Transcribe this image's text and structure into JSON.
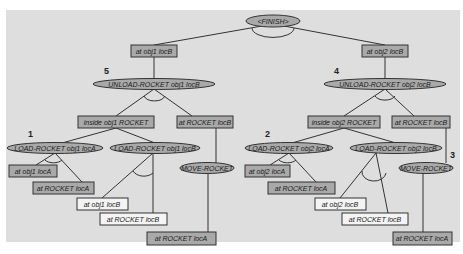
{
  "diagram": {
    "type": "planning-goal-tree",
    "colors": {
      "background": "#dedede",
      "page": "#ffffff",
      "node_fill_gray": "#a9a9a9",
      "node_fill_white": "#f4f4f4",
      "stroke": "#333333"
    },
    "root": {
      "label": "<FINISH>"
    },
    "goals": [
      {
        "id": "g1",
        "label": "at obj1 locB"
      },
      {
        "id": "g2",
        "label": "at obj2 locB"
      }
    ],
    "step_numbers": {
      "s5": "5",
      "s4": "4",
      "s1": "1",
      "s2": "2",
      "s3": "3"
    },
    "actions": {
      "unload1": "UNLOAD-ROCKET obj1 locB",
      "unload2": "UNLOAD-ROCKET obj2 locB",
      "load1a": "LOAD-ROCKET obj1 locA",
      "load1b": "LOAD-ROCKET obj1 locB",
      "move1": "MOVE-ROCKET",
      "load2a": "LOAD-ROCKET obj2 locA",
      "load2b": "LOAD-ROCKET obj2 locB",
      "move2": "MOVE-ROCKET"
    },
    "conditions": {
      "inside1": "inside obj1 ROCKET",
      "atrocketB1": "at ROCKET locB",
      "inside2": "inside obj2 ROCKET",
      "atrocketB2": "at ROCKET locB",
      "at_obj1_locA": "at obj1 locA",
      "at_rocket_locA_1": "at ROCKET locA",
      "at_obj1_locB": "at obj1 locB",
      "at_rocket_locB_1": "at ROCKET locB",
      "at_rocket_locA_m1": "at ROCKET locA",
      "at_obj2_locA": "at obj2 locA",
      "at_rocket_locA_2": "at ROCKET locA",
      "at_obj2_locB": "at obj2 locB",
      "at_rocket_locB_2": "at ROCKET locB",
      "at_rocket_locA_m2": "at ROCKET locA"
    }
  }
}
